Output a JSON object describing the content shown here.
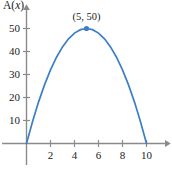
{
  "chart_data": {
    "type": "line",
    "title": "",
    "subtitle": "",
    "xlabel": "",
    "ylabel": "A(x)",
    "ylabel_parts": {
      "func": "A(",
      "var": "x",
      "close": ")"
    },
    "function": "A(x) = 2x(10 - x)",
    "xlim": [
      -0.6,
      11.6
    ],
    "ylim": [
      -6,
      57
    ],
    "grid": false,
    "legend": null,
    "xticks": [
      2,
      4,
      6,
      8,
      10
    ],
    "xtick_labels": [
      "2",
      "4",
      "6",
      "8",
      "10"
    ],
    "yticks": [
      10,
      20,
      30,
      40,
      50
    ],
    "ytick_labels": [
      "10",
      "20",
      "30",
      "40",
      "50"
    ],
    "series": [
      {
        "name": "A(x)",
        "color": "#3d7ec4",
        "x": [
          0,
          0.5,
          1,
          1.5,
          2,
          2.5,
          3,
          3.5,
          4,
          4.5,
          5,
          5.5,
          6,
          6.5,
          7,
          7.5,
          8,
          8.5,
          9,
          9.5,
          10
        ],
        "values": [
          0,
          9.5,
          18,
          25.5,
          32,
          37.5,
          42,
          45.5,
          48,
          49.5,
          50,
          49.5,
          48,
          45.5,
          42,
          37.5,
          32,
          25.5,
          18,
          9.5,
          0
        ]
      }
    ],
    "annotations": [
      {
        "label": "(5, 50)",
        "x": 5,
        "y": 50,
        "marker": "dot",
        "marker_color": "#3d7ec4"
      }
    ],
    "colors": {
      "curve": "#3d7ec4",
      "axis": "#8a8a8a",
      "text": "#1a1a1a",
      "background": "#ffffff",
      "marker": "#3d7ec4"
    }
  }
}
